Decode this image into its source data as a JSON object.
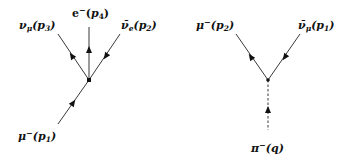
{
  "diagrams": [
    {
      "name": "muon-decay",
      "vertex": {
        "x": 89,
        "y": 80
      },
      "legs": [
        {
          "particle": "ν_μ",
          "momentum": "p3",
          "label": "νμ(p3)",
          "base": "ν",
          "sub": "μ",
          "sup": "",
          "mom": "p",
          "momsub": "3",
          "direction": "outgoing",
          "end": {
            "x": 58,
            "y": 34
          }
        },
        {
          "particle": "e⁻",
          "momentum": "p4",
          "label": "e⁻(p4)",
          "base": "e",
          "sub": "",
          "sup": "−",
          "mom": "p",
          "momsub": "4",
          "direction": "outgoing",
          "end": {
            "x": 89,
            "y": 27
          }
        },
        {
          "particle": "ν̄_e",
          "momentum": "p2",
          "label": "ν̄e(p2)",
          "base": "ν̄",
          "sub": "e",
          "sup": "",
          "mom": "p",
          "momsub": "2",
          "direction": "incoming",
          "end": {
            "x": 120,
            "y": 34
          }
        },
        {
          "particle": "μ⁻",
          "momentum": "p1",
          "label": "μ⁻(p1)",
          "base": "μ",
          "sub": "",
          "sup": "−",
          "mom": "p",
          "momsub": "1",
          "direction": "incoming",
          "end": {
            "x": 58,
            "y": 124
          }
        }
      ]
    },
    {
      "name": "pion-decay",
      "vertex": {
        "x": 268,
        "y": 80
      },
      "legs": [
        {
          "particle": "μ⁻",
          "momentum": "p2",
          "label": "μ⁻(p2)",
          "base": "μ",
          "sub": "",
          "sup": "−",
          "mom": "p",
          "momsub": "2",
          "direction": "outgoing",
          "end": {
            "x": 236,
            "y": 34
          }
        },
        {
          "particle": "ν̄_μ",
          "momentum": "p1",
          "label": "ν̄μ(p1)",
          "base": "ν̄",
          "sub": "μ",
          "sup": "",
          "mom": "p",
          "momsub": "1",
          "direction": "incoming",
          "end": {
            "x": 300,
            "y": 34
          }
        },
        {
          "particle": "π⁻",
          "momentum": "q",
          "label": "π⁻(q)",
          "base": "π",
          "sub": "",
          "sup": "−",
          "mom": "q",
          "momsub": "",
          "direction": "incoming",
          "line": "dashed",
          "end": {
            "x": 268,
            "y": 130
          }
        }
      ]
    }
  ]
}
